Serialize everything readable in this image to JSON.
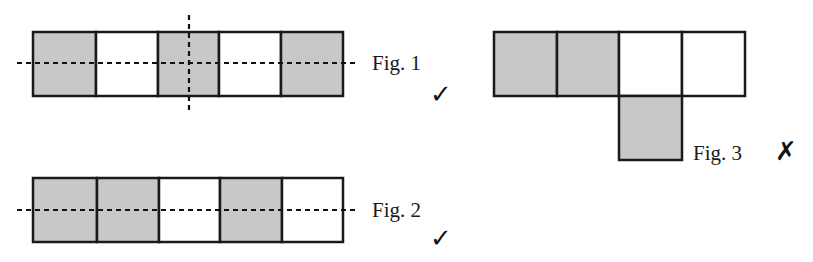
{
  "colors": {
    "shaded": "#c8c8c8",
    "unshaded": "#ffffff",
    "stroke": "#1a1a1a"
  },
  "figures": [
    {
      "label": "Fig. 1",
      "mark": "✓",
      "mark_meaning": "correct",
      "cells": [
        "shaded",
        "unshaded",
        "shaded",
        "unshaded",
        "shaded"
      ],
      "symmetry_lines": [
        "horizontal",
        "vertical"
      ]
    },
    {
      "label": "Fig. 2",
      "mark": "✓",
      "mark_meaning": "correct",
      "cells": [
        "shaded",
        "shaded",
        "unshaded",
        "shaded",
        "unshaded"
      ],
      "symmetry_lines": [
        "horizontal"
      ]
    },
    {
      "label": "Fig. 3",
      "mark": "✗",
      "mark_meaning": "incorrect",
      "top_row_cells": [
        "shaded",
        "shaded",
        "unshaded",
        "unshaded"
      ],
      "bottom_cell": "shaded",
      "symmetry_lines": []
    }
  ]
}
